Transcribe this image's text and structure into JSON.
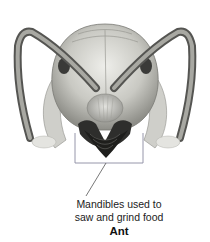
{
  "figure": {
    "callout": {
      "lines": [
        "Mandibles used to",
        "saw and grind food"
      ]
    },
    "title": "Ant"
  }
}
